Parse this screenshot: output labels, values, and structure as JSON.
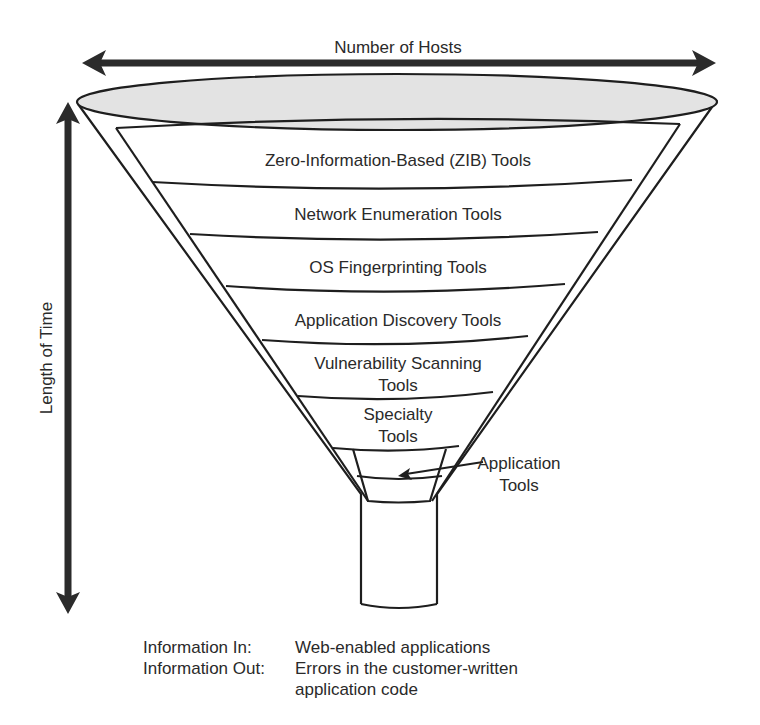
{
  "colors": {
    "stroke": "#1e1e1e",
    "arrow": "#2b2b2b",
    "funnel_mouth_fill": "#e3e3e3",
    "background": "#ffffff",
    "text": "#2a2a2a"
  },
  "axes": {
    "horizontal": {
      "label": "Number of Hosts",
      "arrow": "double-headed"
    },
    "vertical": {
      "label": "Length of Time",
      "arrow": "double-headed"
    }
  },
  "funnel": {
    "bands": [
      {
        "lines": [
          "Zero-Information-Based (ZIB) Tools"
        ]
      },
      {
        "lines": [
          "Network Enumeration Tools"
        ]
      },
      {
        "lines": [
          "OS Fingerprinting Tools"
        ]
      },
      {
        "lines": [
          "Application Discovery Tools"
        ]
      },
      {
        "lines": [
          "Vulnerability Scanning",
          "Tools"
        ]
      },
      {
        "lines": [
          "Specialty",
          "Tools"
        ]
      }
    ],
    "callout": {
      "lines": [
        "Application",
        "Tools"
      ]
    }
  },
  "info": {
    "in_label": "Information In:",
    "in_value": "Web-enabled applications",
    "out_label": "Information Out:",
    "out_value_line1": "Errors in the customer-written",
    "out_value_line2": "application code"
  }
}
